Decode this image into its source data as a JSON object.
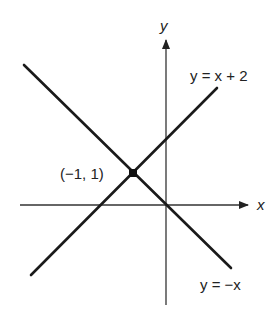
{
  "diagram": {
    "axis_labels": {
      "x": "x",
      "y": "y"
    },
    "lines": [
      {
        "label": "y = x + 2",
        "slope": 1,
        "intercept": 2
      },
      {
        "label": "y = −x",
        "slope": -1,
        "intercept": 0
      }
    ],
    "intersection": {
      "label": "(−1, 1)",
      "x": -1,
      "y": 1
    },
    "colors": {
      "line": "#1a1a1a",
      "axis": "#333333"
    }
  }
}
